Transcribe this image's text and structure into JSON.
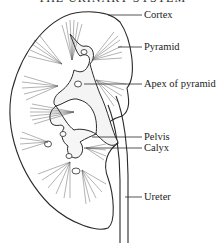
{
  "title": "THE URINARY SYSTEM",
  "labels": [
    {
      "id": "cortex",
      "text": "Cortex",
      "x": 144,
      "y": 9
    },
    {
      "id": "pyramid",
      "text": "Pyramid",
      "x": 144,
      "y": 41
    },
    {
      "id": "apex",
      "text": "Apex of pyramid",
      "x": 144,
      "y": 78
    },
    {
      "id": "pelvis",
      "text": "Pelvis",
      "x": 144,
      "y": 131
    },
    {
      "id": "calyx",
      "text": "Calyx",
      "x": 144,
      "y": 142
    },
    {
      "id": "ureter",
      "text": "Ureter",
      "x": 144,
      "y": 191
    }
  ],
  "colors": {
    "line": "#2a2a2a",
    "background": "#ffffff"
  }
}
